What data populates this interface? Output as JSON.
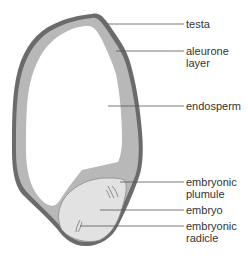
{
  "colors": {
    "testa": "#6b6b6b",
    "aleurone": "#b8b8b8",
    "endosperm": "#ffffff",
    "embryo": "#e2e2e2",
    "leader_line": "#555555",
    "text": "#333333"
  },
  "labels": [
    {
      "id": "testa",
      "text": "testa"
    },
    {
      "id": "aleurone",
      "text": "aleurone\nlayer"
    },
    {
      "id": "endosperm",
      "text": "endosperm"
    },
    {
      "id": "plumule",
      "text": "embryonic\nplumule"
    },
    {
      "id": "embryo",
      "text": "embryo"
    },
    {
      "id": "radicle",
      "text": "embryonic\nradicle"
    }
  ]
}
